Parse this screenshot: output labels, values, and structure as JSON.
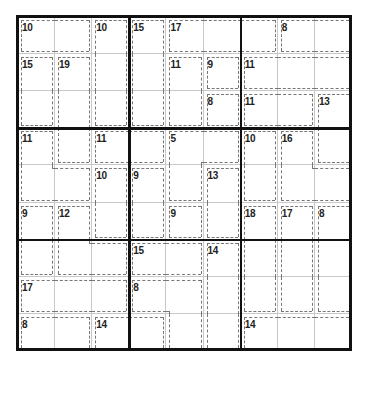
{
  "puzzle": {
    "type": "killer-sudoku",
    "size": 9,
    "values": [
      [
        null,
        null,
        null,
        null,
        null,
        null,
        null,
        null,
        null
      ],
      [
        null,
        null,
        null,
        null,
        null,
        null,
        null,
        null,
        null
      ],
      [
        null,
        null,
        null,
        null,
        null,
        null,
        null,
        null,
        null
      ],
      [
        null,
        null,
        null,
        null,
        null,
        null,
        null,
        null,
        null
      ],
      [
        null,
        null,
        null,
        null,
        null,
        null,
        null,
        null,
        null
      ],
      [
        null,
        null,
        null,
        null,
        null,
        null,
        null,
        null,
        null
      ],
      [
        null,
        null,
        null,
        null,
        null,
        null,
        null,
        null,
        null
      ],
      [
        null,
        null,
        null,
        null,
        null,
        null,
        null,
        null,
        null
      ],
      [
        null,
        null,
        null,
        null,
        null,
        null,
        null,
        null,
        null
      ]
    ],
    "cages": [
      {
        "sum": "10",
        "cells": [
          [
            0,
            0
          ],
          [
            0,
            1
          ]
        ]
      },
      {
        "sum": "10",
        "cells": [
          [
            0,
            2
          ],
          [
            1,
            2
          ],
          [
            2,
            2
          ]
        ]
      },
      {
        "sum": "15",
        "cells": [
          [
            0,
            3
          ],
          [
            1,
            3
          ],
          [
            2,
            3
          ]
        ]
      },
      {
        "sum": "17",
        "cells": [
          [
            0,
            4
          ],
          [
            0,
            5
          ],
          [
            0,
            6
          ]
        ]
      },
      {
        "sum": "8",
        "cells": [
          [
            0,
            7
          ],
          [
            0,
            8
          ]
        ]
      },
      {
        "sum": "15",
        "cells": [
          [
            1,
            0
          ],
          [
            2,
            0
          ]
        ]
      },
      {
        "sum": "19",
        "cells": [
          [
            1,
            1
          ],
          [
            2,
            1
          ],
          [
            3,
            1
          ]
        ]
      },
      {
        "sum": "11",
        "cells": [
          [
            1,
            4
          ],
          [
            2,
            4
          ]
        ]
      },
      {
        "sum": "9",
        "cells": [
          [
            1,
            5
          ]
        ]
      },
      {
        "sum": "11",
        "cells": [
          [
            1,
            6
          ],
          [
            1,
            7
          ],
          [
            1,
            8
          ]
        ]
      },
      {
        "sum": "8",
        "cells": [
          [
            2,
            5
          ]
        ]
      },
      {
        "sum": "11",
        "cells": [
          [
            2,
            6
          ],
          [
            2,
            7
          ]
        ]
      },
      {
        "sum": "13",
        "cells": [
          [
            2,
            8
          ],
          [
            3,
            8
          ]
        ]
      },
      {
        "sum": "11",
        "cells": [
          [
            3,
            0
          ],
          [
            4,
            0
          ],
          [
            4,
            1
          ]
        ]
      },
      {
        "sum": "11",
        "cells": [
          [
            3,
            2
          ],
          [
            3,
            3
          ]
        ]
      },
      {
        "sum": "5",
        "cells": [
          [
            3,
            4
          ],
          [
            3,
            5
          ],
          [
            4,
            4
          ]
        ]
      },
      {
        "sum": "10",
        "cells": [
          [
            3,
            6
          ],
          [
            4,
            6
          ]
        ]
      },
      {
        "sum": "16",
        "cells": [
          [
            3,
            7
          ],
          [
            4,
            7
          ],
          [
            4,
            8
          ]
        ]
      },
      {
        "sum": "10",
        "cells": [
          [
            4,
            2
          ],
          [
            5,
            2
          ]
        ]
      },
      {
        "sum": "9",
        "cells": [
          [
            4,
            3
          ],
          [
            5,
            3
          ]
        ]
      },
      {
        "sum": "13",
        "cells": [
          [
            4,
            5
          ],
          [
            5,
            5
          ]
        ]
      },
      {
        "sum": "9",
        "cells": [
          [
            5,
            0
          ],
          [
            6,
            0
          ]
        ]
      },
      {
        "sum": "12",
        "cells": [
          [
            5,
            1
          ],
          [
            6,
            1
          ],
          [
            6,
            2
          ]
        ]
      },
      {
        "sum": "9",
        "cells": [
          [
            5,
            4
          ]
        ]
      },
      {
        "sum": "18",
        "cells": [
          [
            5,
            6
          ],
          [
            6,
            6
          ],
          [
            7,
            6
          ]
        ]
      },
      {
        "sum": "17",
        "cells": [
          [
            5,
            7
          ],
          [
            6,
            7
          ],
          [
            7,
            7
          ]
        ]
      },
      {
        "sum": "8",
        "cells": [
          [
            5,
            8
          ],
          [
            6,
            8
          ],
          [
            7,
            8
          ]
        ]
      },
      {
        "sum": "15",
        "cells": [
          [
            6,
            3
          ],
          [
            6,
            4
          ]
        ]
      },
      {
        "sum": "14",
        "cells": [
          [
            6,
            5
          ],
          [
            7,
            5
          ],
          [
            8,
            5
          ]
        ]
      },
      {
        "sum": "17",
        "cells": [
          [
            7,
            0
          ],
          [
            7,
            1
          ],
          [
            7,
            2
          ]
        ]
      },
      {
        "sum": "8",
        "cells": [
          [
            7,
            3
          ],
          [
            7,
            4
          ],
          [
            8,
            4
          ]
        ]
      },
      {
        "sum": "8",
        "cells": [
          [
            8,
            0
          ],
          [
            8,
            1
          ]
        ]
      },
      {
        "sum": "14",
        "cells": [
          [
            8,
            2
          ],
          [
            8,
            3
          ]
        ]
      },
      {
        "sum": "14",
        "cells": [
          [
            8,
            6
          ],
          [
            8,
            7
          ],
          [
            8,
            8
          ]
        ]
      }
    ]
  },
  "colors": {
    "grid_thick": "#111111",
    "grid_thin": "#c8c8c8",
    "cage_border": "#777777",
    "sum_text": "#222222"
  }
}
